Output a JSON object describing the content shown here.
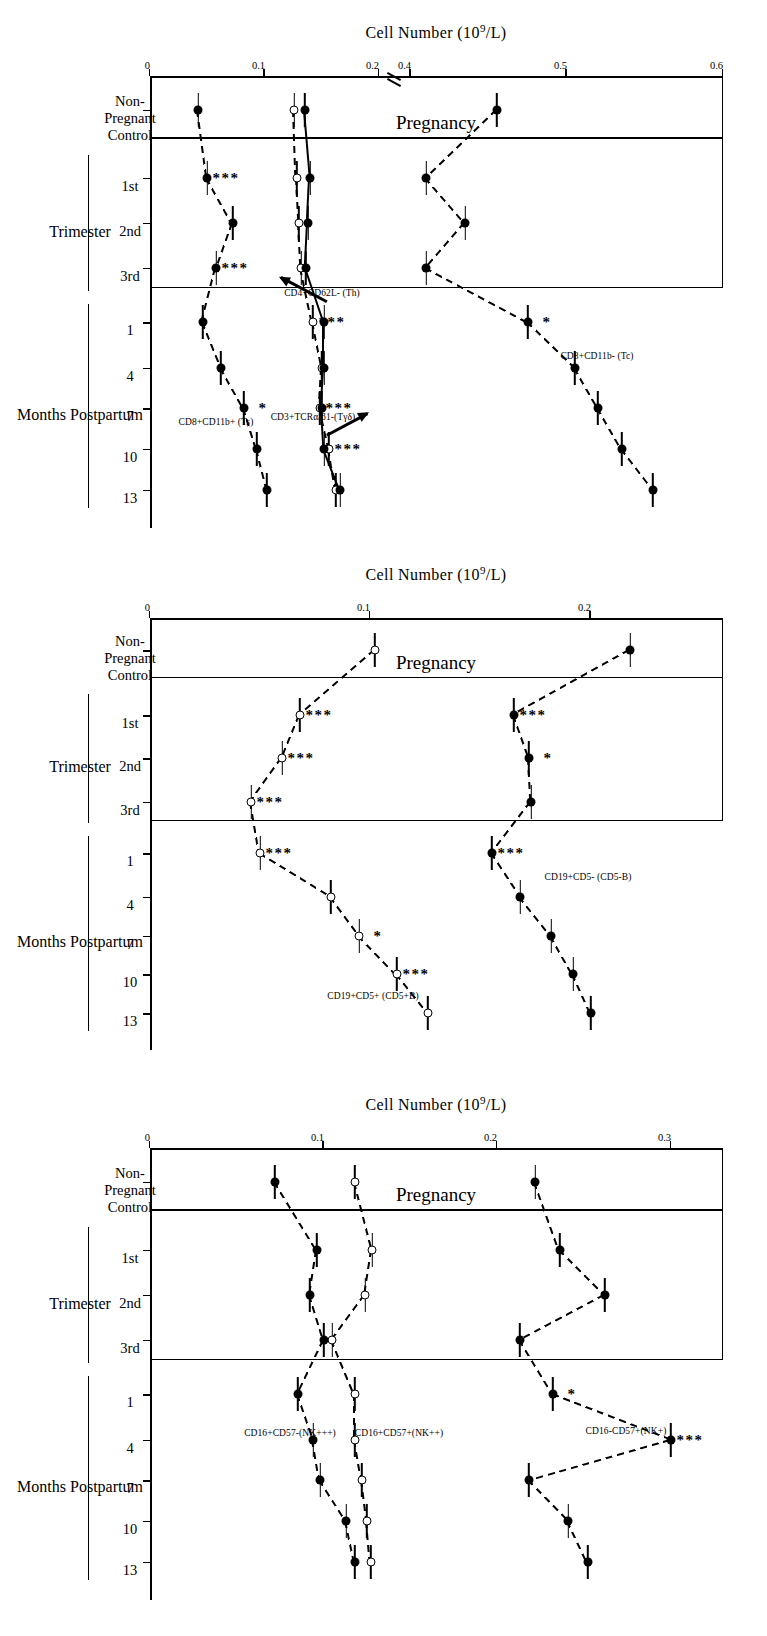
{
  "figure": {
    "axis_title": "Cell Number (10 9/L)",
    "axis_title_parts": {
      "pre": "Cell Number (10",
      "sup": "9",
      "post": "/L)"
    },
    "pregnancy_label": "Pregnancy",
    "group_trimester": "Trimester",
    "group_postpartum": "Months Postpartum",
    "xlabels": [
      "Non-",
      "Pregnant",
      "Control",
      "1st",
      "2nd",
      "3rd",
      "1",
      "4",
      "7",
      "10",
      "13"
    ],
    "x_nonpregnant": [
      "Non-",
      "Pregnant",
      "Control"
    ],
    "x_trimester": [
      "1st",
      "2nd",
      "3rd"
    ],
    "x_postpartum": [
      "1",
      "4",
      "7",
      "10",
      "13"
    ]
  },
  "chart_data": [
    {
      "type": "line",
      "panel": "A",
      "title": "",
      "xlabel": "",
      "ylabel": "Cell Number (10^9/L)",
      "categories": [
        "Non-Pregnant Control",
        "1st",
        "2nd",
        "3rd",
        "1",
        "4",
        "7",
        "10",
        "13"
      ],
      "ytick_labels": [
        "0",
        "0.1",
        "0.2",
        "0.4",
        "0.5",
        "0.6"
      ],
      "ytick_values": [
        0,
        0.1,
        0.2,
        0.4,
        0.5,
        0.6
      ],
      "ylim": [
        0,
        0.6
      ],
      "axis_break": true,
      "axis_break_between": [
        0.2,
        0.4
      ],
      "grid": false,
      "legend_position": "inline-right",
      "series": [
        {
          "name": "CD8+CD11b- (Tc)",
          "marker": "filled",
          "values": [
            0.455,
            0.41,
            0.435,
            0.41,
            0.475,
            0.505,
            0.52,
            0.535,
            0.555
          ],
          "errors": [
            0.018,
            0.022,
            0.028,
            0.02,
            0.03,
            0.032,
            0.035,
            0.035,
            0.035
          ],
          "significance": [
            "",
            "",
            "",
            "",
            "*",
            "",
            "",
            "",
            ""
          ]
        },
        {
          "name": "CD4+CD62L- (Th)",
          "marker": "open",
          "values": [
            0.126,
            0.128,
            0.13,
            0.132,
            0.142,
            0.15,
            0.148,
            0.156,
            0.162
          ],
          "errors": [
            0.012,
            0.013,
            0.014,
            0.013,
            0.015,
            0.014,
            0.015,
            0.015,
            0.012
          ],
          "significance": [
            "",
            "",
            "",
            "",
            "***",
            "",
            "***",
            "***",
            ""
          ]
        },
        {
          "name": "CD3+TCRα/β1-(Tγδ)",
          "marker": "filled",
          "values": [
            0.135,
            0.14,
            0.138,
            0.136,
            0.152,
            0.152,
            0.15,
            0.152,
            0.166
          ],
          "errors": [
            0.013,
            0.014,
            0.014,
            0.014,
            0.016,
            0.014,
            0.015,
            0.015,
            0.013
          ],
          "significance": [
            "",
            "",
            "",
            "",
            "",
            "",
            "",
            "",
            ""
          ]
        },
        {
          "name": "CD8+CD11b+ (Ts)",
          "marker": "filled",
          "values": [
            0.042,
            0.05,
            0.072,
            0.058,
            0.046,
            0.062,
            0.082,
            0.093,
            0.102
          ],
          "errors": [
            0.012,
            0.013,
            0.018,
            0.014,
            0.012,
            0.014,
            0.016,
            0.018,
            0.013
          ],
          "significance": [
            "",
            "***",
            "",
            "***",
            "",
            "",
            "*",
            "",
            ""
          ]
        }
      ]
    },
    {
      "type": "line",
      "panel": "B",
      "title": "",
      "xlabel": "",
      "ylabel": "Cell Number (10^9/L)",
      "categories": [
        "Non-Pregnant Control",
        "1st",
        "2nd",
        "3rd",
        "1",
        "4",
        "7",
        "10",
        "13"
      ],
      "ytick_labels": [
        "0",
        "0.1",
        "0.2"
      ],
      "ytick_values": [
        0,
        0.1,
        0.2
      ],
      "ylim": [
        0,
        0.26
      ],
      "axis_break": false,
      "grid": false,
      "legend_position": "inline-right",
      "series": [
        {
          "name": "CD19+CD5- (CD5-B)",
          "marker": "filled",
          "values": [
            0.218,
            0.165,
            0.172,
            0.173,
            0.155,
            0.168,
            0.182,
            0.192,
            0.2
          ],
          "errors": [
            0.02,
            0.026,
            0.023,
            0.024,
            0.023,
            0.026,
            0.025,
            0.028,
            0.024
          ],
          "significance": [
            "",
            "***",
            "*",
            "",
            "***",
            "",
            "",
            "",
            ""
          ]
        },
        {
          "name": "CD19+CD5+ (CD5+B)",
          "marker": "open",
          "values": [
            0.102,
            0.068,
            0.06,
            0.046,
            0.05,
            0.082,
            0.095,
            0.112,
            0.126
          ],
          "errors": [
            0.016,
            0.018,
            0.017,
            0.016,
            0.018,
            0.02,
            0.021,
            0.021,
            0.016
          ],
          "significance": [
            "",
            "***",
            "***",
            "***",
            "***",
            "",
            "*",
            "***",
            ""
          ]
        }
      ]
    },
    {
      "type": "line",
      "panel": "C",
      "title": "",
      "xlabel": "",
      "ylabel": "Cell Number (10^9/L)",
      "categories": [
        "Non-Pregnant Control",
        "1st",
        "2nd",
        "3rd",
        "1",
        "4",
        "7",
        "10",
        "13"
      ],
      "ytick_labels": [
        "0",
        "0.1",
        "0.2",
        "0.3"
      ],
      "ytick_values": [
        0,
        0.1,
        0.2,
        0.3
      ],
      "ylim": [
        0,
        0.33
      ],
      "axis_break": false,
      "grid": false,
      "legend_position": "inline-right",
      "series": [
        {
          "name": "CD16-CD57+(NK+)",
          "marker": "filled",
          "values": [
            0.222,
            0.236,
            0.262,
            0.213,
            0.232,
            0.3,
            0.218,
            0.241,
            0.252
          ],
          "errors": [
            0.022,
            0.028,
            0.03,
            0.026,
            0.028,
            0.03,
            0.028,
            0.03,
            0.03
          ],
          "significance": [
            "",
            "",
            "",
            "",
            "*",
            "***",
            "",
            "",
            ""
          ]
        },
        {
          "name": "CD16+CD57+(NK++)",
          "marker": "open",
          "values": [
            0.118,
            0.128,
            0.124,
            0.105,
            0.118,
            0.118,
            0.122,
            0.125,
            0.127
          ],
          "errors": [
            0.018,
            0.02,
            0.02,
            0.018,
            0.02,
            0.019,
            0.02,
            0.02,
            0.018
          ],
          "significance": [
            "",
            "",
            "",
            "",
            "",
            "",
            "",
            "",
            ""
          ]
        },
        {
          "name": "CD16+CD57-(NK+++)",
          "marker": "filled",
          "values": [
            0.072,
            0.096,
            0.092,
            0.1,
            0.085,
            0.094,
            0.098,
            0.113,
            0.118
          ],
          "errors": [
            0.016,
            0.018,
            0.018,
            0.018,
            0.018,
            0.018,
            0.018,
            0.019,
            0.016
          ],
          "significance": [
            "",
            "",
            "",
            "",
            "",
            "",
            "",
            "",
            ""
          ]
        }
      ]
    }
  ]
}
